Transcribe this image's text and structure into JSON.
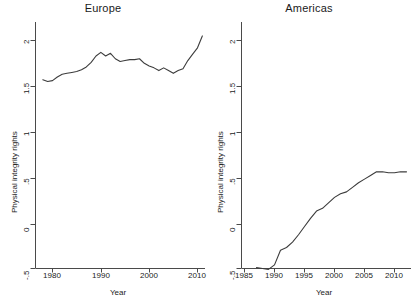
{
  "chart_data": [
    {
      "type": "line",
      "title": "Europe",
      "xlabel": "Year",
      "ylabel": "Physical integrity rights",
      "xlim": [
        1977,
        2012
      ],
      "ylim": [
        -0.5,
        2.1
      ],
      "xticks": [
        1980,
        1990,
        2000,
        2010
      ],
      "xtick_labels": [
        "1980",
        "1990",
        "2000",
        "2010"
      ],
      "yticks": [
        -0.5,
        0,
        0.5,
        1,
        1.5,
        2
      ],
      "ytick_labels": [
        "-.5",
        "0",
        ".5",
        "1",
        "1.5",
        "2"
      ],
      "grid": false,
      "legend": "none",
      "line_color": "#3c3c3c",
      "x": [
        1978,
        1979,
        1980,
        1981,
        1982,
        1983,
        1984,
        1985,
        1986,
        1987,
        1988,
        1989,
        1990,
        1991,
        1992,
        1993,
        1994,
        1995,
        1996,
        1997,
        1998,
        1999,
        2000,
        2001,
        2002,
        2003,
        2004,
        2005,
        2006,
        2007,
        2008,
        2009,
        2010,
        2011
      ],
      "values": [
        1.57,
        1.55,
        1.56,
        1.6,
        1.63,
        1.64,
        1.65,
        1.66,
        1.68,
        1.71,
        1.76,
        1.83,
        1.87,
        1.83,
        1.86,
        1.8,
        1.77,
        1.78,
        1.79,
        1.79,
        1.8,
        1.75,
        1.72,
        1.7,
        1.67,
        1.7,
        1.67,
        1.64,
        1.67,
        1.69,
        1.78,
        1.85,
        1.92,
        2.05
      ]
    },
    {
      "type": "line",
      "title": "Americas",
      "xlabel": "Year",
      "ylabel": "Physical integrity rights",
      "xlim": [
        1983,
        2013
      ],
      "ylim": [
        -0.5,
        2.1
      ],
      "xticks": [
        1985,
        1990,
        1995,
        2000,
        2005,
        2010
      ],
      "xtick_labels": [
        "1985",
        "1990",
        "1995",
        "2000",
        "2005",
        "2010"
      ],
      "yticks": [
        -0.5,
        0,
        0.5,
        1,
        1.5,
        2
      ],
      "ytick_labels": [
        "-.5",
        "0",
        ".5",
        "1",
        "1.5",
        "2"
      ],
      "grid": false,
      "legend": "none",
      "line_color": "#3c3c3c",
      "x": [
        1987,
        1988,
        1989,
        1990,
        1991,
        1992,
        1993,
        1994,
        1995,
        1996,
        1997,
        1998,
        1999,
        2000,
        2001,
        2002,
        2003,
        2004,
        2005,
        2006,
        2007,
        2008,
        2009,
        2010,
        2011,
        2012
      ],
      "values": [
        -0.49,
        -0.5,
        -0.51,
        -0.46,
        -0.3,
        -0.27,
        -0.21,
        -0.13,
        -0.04,
        0.05,
        0.13,
        0.16,
        0.22,
        0.28,
        0.32,
        0.34,
        0.39,
        0.44,
        0.48,
        0.52,
        0.56,
        0.56,
        0.55,
        0.55,
        0.56,
        0.56
      ]
    }
  ]
}
